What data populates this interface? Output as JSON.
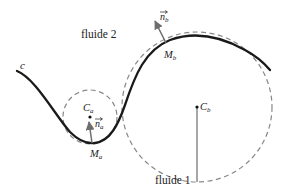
{
  "diagram": {
    "labels": {
      "fluid_top": "fluide 2",
      "fluid_bottom": "fluide 1",
      "curve": "c",
      "point_a": "M",
      "point_a_sub": "a",
      "point_b": "M",
      "point_b_sub": "b",
      "center_a": "C",
      "center_a_sub": "a",
      "center_b": "C",
      "center_b_sub": "b",
      "normal_a": "n",
      "normal_a_sub": "a",
      "normal_b": "n",
      "normal_b_sub": "b"
    },
    "colors": {
      "curve": "#1a1a1a",
      "circles": "#808080",
      "arrows": "#6e6e6e",
      "text": "#222222"
    }
  }
}
